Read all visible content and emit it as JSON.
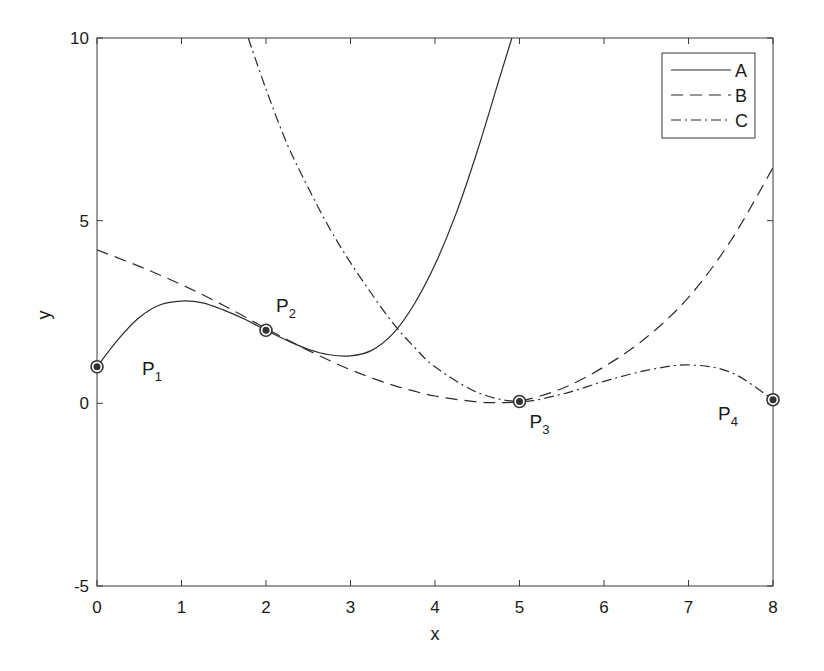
{
  "chart_data": {
    "type": "line",
    "title": "",
    "xlabel": "x",
    "ylabel": "y",
    "xlim": [
      0,
      8
    ],
    "ylim": [
      -5,
      10
    ],
    "xticks": [
      0,
      1,
      2,
      3,
      4,
      5,
      6,
      7,
      8
    ],
    "yticks": [
      -5,
      0,
      5,
      10
    ],
    "grid": false,
    "legend_position": "upper right",
    "series": [
      {
        "name": "A",
        "style": "solid",
        "x": [
          0,
          0.25,
          0.5,
          0.75,
          1,
          1.25,
          1.5,
          1.75,
          2,
          2.25,
          2.5,
          2.75,
          3,
          3.25,
          3.5,
          3.75,
          4,
          4.25,
          4.5,
          4.75,
          4.91
        ],
        "y": [
          1,
          1.75,
          2.35,
          2.7,
          2.8,
          2.75,
          2.55,
          2.3,
          2.0,
          1.72,
          1.48,
          1.33,
          1.3,
          1.45,
          1.9,
          2.7,
          3.8,
          5.2,
          6.9,
          8.8,
          10
        ]
      },
      {
        "name": "B",
        "style": "dashed",
        "x": [
          0,
          0.5,
          1,
          1.5,
          2,
          2.5,
          3,
          3.5,
          4,
          4.5,
          4.7,
          5,
          5.5,
          6,
          6.5,
          7,
          7.5,
          8
        ],
        "y": [
          4.2,
          3.75,
          3.25,
          2.68,
          2.05,
          1.45,
          0.92,
          0.5,
          0.2,
          0.04,
          0.02,
          0.06,
          0.4,
          1.0,
          1.8,
          2.9,
          4.45,
          6.45
        ]
      },
      {
        "name": "C",
        "style": "dashdot",
        "x": [
          1.79,
          2,
          2.25,
          2.5,
          2.75,
          3,
          3.25,
          3.5,
          3.75,
          4,
          4.5,
          5,
          5.5,
          6,
          6.5,
          7,
          7.5,
          8
        ],
        "y": [
          10,
          8.6,
          7.1,
          5.9,
          4.8,
          3.85,
          3.0,
          2.2,
          1.55,
          1.0,
          0.3,
          0.05,
          0.25,
          0.6,
          0.9,
          1.05,
          0.85,
          0.1
        ]
      }
    ],
    "points": [
      {
        "label": "P",
        "sub": "1",
        "x": 0,
        "y": 1
      },
      {
        "label": "P",
        "sub": "2",
        "x": 2,
        "y": 2
      },
      {
        "label": "P",
        "sub": "3",
        "x": 5,
        "y": 0.05
      },
      {
        "label": "P",
        "sub": "4",
        "x": 8,
        "y": 0.1
      }
    ]
  }
}
